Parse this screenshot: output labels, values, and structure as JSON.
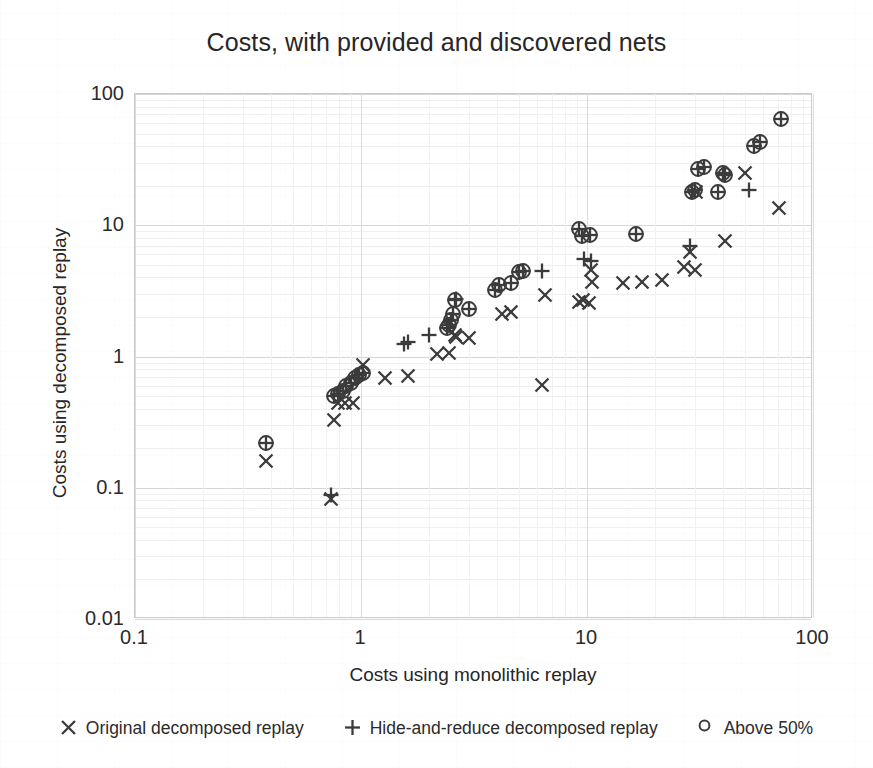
{
  "chart": {
    "title": "Costs, with provided and discovered nets",
    "xlabel": "Costs using monolithic replay",
    "ylabel": "Costs using decomposed replay"
  },
  "legend": [
    {
      "marker": "cross-x-icon",
      "symbol": "×",
      "label": "Original decomposed replay"
    },
    {
      "marker": "plus-icon",
      "symbol": "+",
      "label": "Hide-and-reduce decomposed replay"
    },
    {
      "marker": "circle-outline-icon",
      "symbol": "○",
      "label": "Above 50%"
    }
  ],
  "chart_data": {
    "type": "scatter",
    "title": "Costs, with provided and discovered nets",
    "xlabel": "Costs using monolithic replay",
    "ylabel": "Costs using decomposed replay",
    "xscale": "log",
    "yscale": "log",
    "xlim": [
      0.1,
      100
    ],
    "ylim": [
      0.01,
      100
    ],
    "xticks": [
      "0.1",
      "1",
      "10",
      "100"
    ],
    "yticks": [
      "0.01",
      "0.1",
      "1",
      "10",
      "100"
    ],
    "grid": true,
    "legend_position": "bottom",
    "marker_color": "#3b3b3b",
    "series": [
      {
        "name": "Original decomposed replay",
        "marker": "x",
        "points": [
          [
            0.38,
            0.16
          ],
          [
            0.74,
            0.082
          ],
          [
            0.76,
            0.33
          ],
          [
            0.79,
            0.44
          ],
          [
            0.85,
            0.44
          ],
          [
            0.92,
            0.44
          ],
          [
            1.02,
            0.86
          ],
          [
            1.28,
            0.68
          ],
          [
            1.62,
            0.71
          ],
          [
            2.18,
            1.04
          ],
          [
            2.45,
            1.07
          ],
          [
            2.6,
            1.45
          ],
          [
            2.62,
            1.42
          ],
          [
            3.0,
            1.38
          ],
          [
            4.2,
            2.1
          ],
          [
            4.6,
            2.2
          ],
          [
            6.3,
            0.61
          ],
          [
            6.5,
            2.95
          ],
          [
            9.2,
            2.6
          ],
          [
            9.6,
            2.7
          ],
          [
            10.2,
            2.55
          ],
          [
            10.4,
            4.6
          ],
          [
            10.5,
            3.7
          ],
          [
            14.5,
            3.6
          ],
          [
            17.5,
            3.7
          ],
          [
            21.5,
            3.8
          ],
          [
            27.0,
            4.8
          ],
          [
            28.5,
            6.2
          ],
          [
            30.0,
            4.6
          ],
          [
            30.5,
            18.0
          ],
          [
            41.0,
            7.6
          ],
          [
            50.0,
            25.0
          ],
          [
            71.0,
            13.5
          ]
        ]
      },
      {
        "name": "Hide-and-reduce decomposed replay",
        "marker": "+",
        "points": [
          [
            0.38,
            0.22
          ],
          [
            0.74,
            0.088
          ],
          [
            0.76,
            0.5
          ],
          [
            0.79,
            0.52
          ],
          [
            0.83,
            0.55
          ],
          [
            0.86,
            0.6
          ],
          [
            0.9,
            0.63
          ],
          [
            0.94,
            0.68
          ],
          [
            0.98,
            0.72
          ],
          [
            1.02,
            0.75
          ],
          [
            1.55,
            1.25
          ],
          [
            1.62,
            1.3
          ],
          [
            2.0,
            1.45
          ],
          [
            2.4,
            1.65
          ],
          [
            2.45,
            1.75
          ],
          [
            2.5,
            1.9
          ],
          [
            2.55,
            2.1
          ],
          [
            2.6,
            2.7
          ],
          [
            2.62,
            2.75
          ],
          [
            3.0,
            2.3
          ],
          [
            3.9,
            3.2
          ],
          [
            4.1,
            3.5
          ],
          [
            4.6,
            3.6
          ],
          [
            5.0,
            4.4
          ],
          [
            5.2,
            4.5
          ],
          [
            6.3,
            4.5
          ],
          [
            9.2,
            9.3
          ],
          [
            9.5,
            8.3
          ],
          [
            9.7,
            5.5
          ],
          [
            10.3,
            8.4
          ],
          [
            10.4,
            5.3
          ],
          [
            16.5,
            8.6
          ],
          [
            28.5,
            6.9
          ],
          [
            29.0,
            18.0
          ],
          [
            30.0,
            18.5
          ],
          [
            31.0,
            27.0
          ],
          [
            33.0,
            28.0
          ],
          [
            38.0,
            18.0
          ],
          [
            40.0,
            25.0
          ],
          [
            41.0,
            24.0
          ],
          [
            52.0,
            18.5
          ],
          [
            55.0,
            40.0
          ],
          [
            58.0,
            43.0
          ],
          [
            72.0,
            65.0
          ]
        ]
      },
      {
        "name": "Above 50%",
        "marker": "o",
        "points": [
          [
            0.38,
            0.22
          ],
          [
            0.76,
            0.5
          ],
          [
            0.79,
            0.52
          ],
          [
            0.83,
            0.55
          ],
          [
            0.86,
            0.6
          ],
          [
            0.9,
            0.63
          ],
          [
            0.94,
            0.68
          ],
          [
            0.98,
            0.72
          ],
          [
            1.02,
            0.75
          ],
          [
            2.4,
            1.65
          ],
          [
            2.45,
            1.75
          ],
          [
            2.5,
            1.9
          ],
          [
            2.55,
            2.1
          ],
          [
            2.6,
            2.7
          ],
          [
            3.0,
            2.3
          ],
          [
            3.9,
            3.2
          ],
          [
            4.1,
            3.5
          ],
          [
            4.6,
            3.6
          ],
          [
            5.0,
            4.4
          ],
          [
            5.2,
            4.5
          ],
          [
            9.2,
            9.3
          ],
          [
            9.5,
            8.3
          ],
          [
            10.3,
            8.4
          ],
          [
            16.5,
            8.6
          ],
          [
            29.0,
            18.0
          ],
          [
            30.0,
            18.5
          ],
          [
            31.0,
            27.0
          ],
          [
            33.0,
            28.0
          ],
          [
            38.0,
            18.0
          ],
          [
            40.0,
            25.0
          ],
          [
            41.0,
            24.0
          ],
          [
            55.0,
            40.0
          ],
          [
            58.0,
            43.0
          ],
          [
            72.0,
            65.0
          ]
        ]
      }
    ]
  }
}
